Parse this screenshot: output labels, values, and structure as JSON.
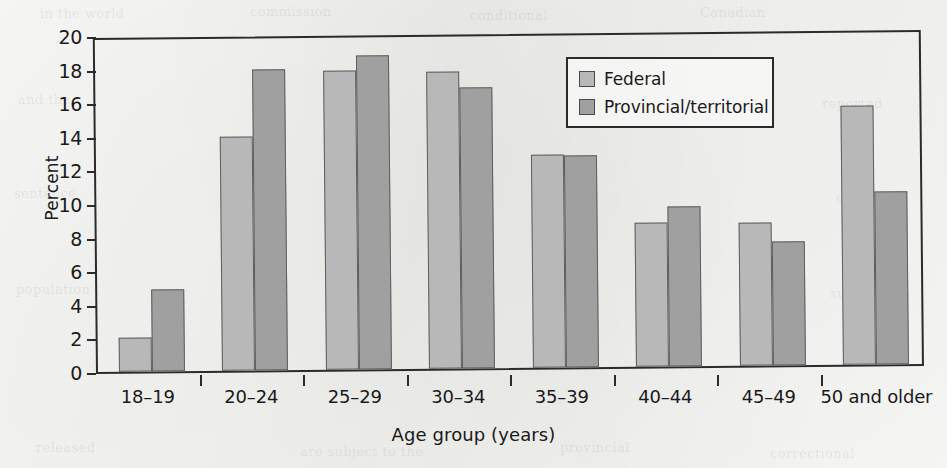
{
  "chart_data": {
    "type": "bar",
    "title": "",
    "subtitle": "",
    "xlabel": "Age group (years)",
    "ylabel": "Percent",
    "categories": [
      "18–19",
      "20–24",
      "25–29",
      "30–34",
      "35–39",
      "40–44",
      "45–49",
      "50 and older"
    ],
    "series": [
      {
        "name": "Federal",
        "color": "#b8b8b8",
        "values": [
          2.0,
          13.9,
          17.8,
          17.7,
          12.7,
          8.6,
          8.5,
          15.4
        ]
      },
      {
        "name": "Provincial/territorial",
        "color": "#a0a0a0",
        "values": [
          4.9,
          17.9,
          18.7,
          16.7,
          12.6,
          9.5,
          7.4,
          10.3
        ]
      }
    ],
    "ylim": [
      0,
      20
    ],
    "ytick_values": [
      0,
      2,
      4,
      6,
      8,
      10,
      12,
      14,
      16,
      18,
      20
    ],
    "ytick_labels": [
      "0",
      "2",
      "4",
      "6",
      "8",
      "10",
      "12",
      "14",
      "16",
      "18",
      "20"
    ],
    "grid": false,
    "legend_position": "upper center",
    "bar_outline_color": "#5e5e5e",
    "axis_color": "#2b2b2b",
    "background_color": "#f8f8f6"
  },
  "legend": {
    "entries": [
      {
        "label": "Federal",
        "swatch": "federal"
      },
      {
        "label": "Provincial/territorial",
        "swatch": "provincial"
      }
    ]
  },
  "page_bleed": [
    "in the world",
    "commission",
    "conditional",
    "Canadian",
    "and the",
    "reported",
    "sentence",
    "offenders",
    "population",
    "supervision",
    "released",
    "are subject to the",
    "provincial",
    "correctional"
  ]
}
